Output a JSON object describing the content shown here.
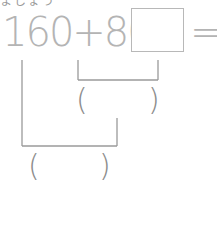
{
  "header": {
    "partial_text": "ましょう"
  },
  "expression": {
    "terms": [
      "160",
      "+",
      "80",
      "×"
    ],
    "text": "160+80×",
    "equals": "="
  },
  "answer_box": {
    "value": ""
  },
  "brackets": [
    {
      "id": "step1",
      "spans": "80×□",
      "left_paren": "(",
      "right_paren": ")",
      "answer": ""
    },
    {
      "id": "step2",
      "spans": "160+(80×□)",
      "left_paren": "(",
      "right_paren": ")",
      "answer": ""
    }
  ],
  "colors": {
    "expression": "#b4b4b4",
    "lines": "#9a9a9a",
    "parens": "#8c8c8c"
  }
}
